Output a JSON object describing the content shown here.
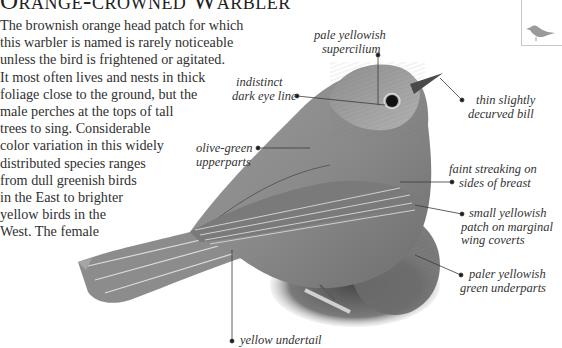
{
  "page": {
    "title": "Orange-crowned Warbler",
    "body_lines": [
      "The brownish orange head patch for which",
      "this warbler is named is rarely noticeable",
      "unless the bird is frightened or agitated.",
      "It most often lives and nests in thick",
      "foliage close to the ground, but the",
      "male perches at the tops of tall",
      "trees to sing. Considerable",
      "color variation in this widely",
      "distributed species ranges",
      "from dull greenish birds",
      "in the East to brighter",
      "yellow birds in the",
      "West. The female"
    ]
  },
  "thumbnail": {
    "icon": "bird-silhouette-icon"
  },
  "callouts": {
    "supercilium": {
      "line1": "pale yellowish",
      "line2": "supercilium"
    },
    "eye_line": {
      "line1": "indistinct",
      "line2": "dark eye line"
    },
    "bill": {
      "line1": "thin slightly",
      "line2": "decurved bill"
    },
    "upperparts": {
      "line1": "olive-green",
      "line2": "upperparts"
    },
    "breast": {
      "line1": "faint streaking on",
      "line2": "sides of breast"
    },
    "wing_patch": {
      "line1": "small yellowish",
      "line2": "patch on marginal",
      "line3": "wing coverts"
    },
    "underparts": {
      "line1": "paler yellowish",
      "line2": "green underparts"
    },
    "undertail": {
      "line1": "yellow undertail"
    }
  },
  "colors": {
    "text": "#303030",
    "leader_line": "#3a3a3a",
    "bird_light": "#b8b8b8",
    "bird_dark": "#5a5a5a",
    "foliage": "#6b6b6b"
  }
}
